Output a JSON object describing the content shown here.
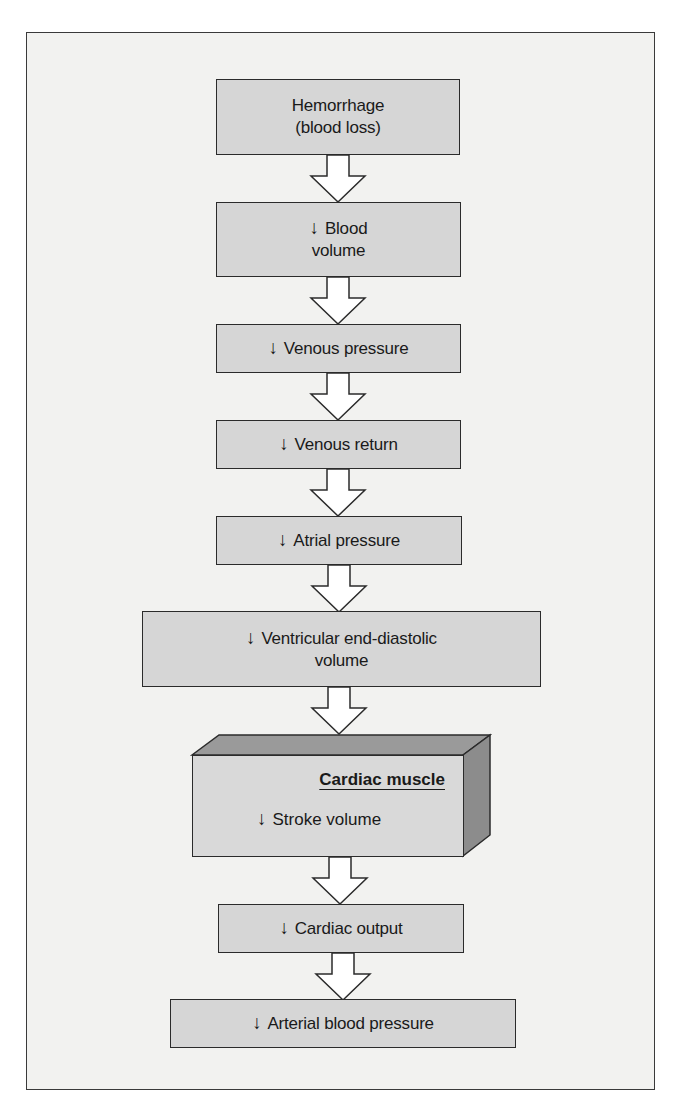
{
  "diagram": {
    "colors": {
      "background": "#f2f2f0",
      "box_fill": "#d6d6d6",
      "box_border": "#2b2b2b",
      "cube_top": "#9a9a9a",
      "cube_side": "#8c8c8c",
      "arrow_fill": "#ffffff"
    },
    "down_symbol": "↓",
    "nodes": [
      {
        "id": "hemorrhage",
        "line1": "Hemorrhage",
        "line2": "(blood loss)",
        "decrease": false
      },
      {
        "id": "blood-volume",
        "line1": "Blood",
        "line2": "volume",
        "decrease": true
      },
      {
        "id": "venous-pressure",
        "line1": "Venous pressure",
        "decrease": true
      },
      {
        "id": "venous-return",
        "line1": "Venous return",
        "decrease": true
      },
      {
        "id": "atrial-pressure",
        "line1": "Atrial pressure",
        "decrease": true
      },
      {
        "id": "ventricular-edv",
        "line1": "Ventricular end-diastolic",
        "line2": "volume",
        "decrease": true
      },
      {
        "id": "cardiac-muscle",
        "title": "Cardiac muscle",
        "line1": "Stroke volume",
        "decrease": true
      },
      {
        "id": "cardiac-output",
        "line1": "Cardiac output",
        "decrease": true
      },
      {
        "id": "arterial-bp",
        "line1": "Arterial blood pressure",
        "decrease": true
      }
    ],
    "edges": [
      {
        "from": "hemorrhage",
        "to": "blood-volume"
      },
      {
        "from": "blood-volume",
        "to": "venous-pressure"
      },
      {
        "from": "venous-pressure",
        "to": "venous-return"
      },
      {
        "from": "venous-return",
        "to": "atrial-pressure"
      },
      {
        "from": "atrial-pressure",
        "to": "ventricular-edv"
      },
      {
        "from": "ventricular-edv",
        "to": "cardiac-muscle"
      },
      {
        "from": "cardiac-muscle",
        "to": "cardiac-output"
      },
      {
        "from": "cardiac-output",
        "to": "arterial-bp"
      }
    ]
  }
}
